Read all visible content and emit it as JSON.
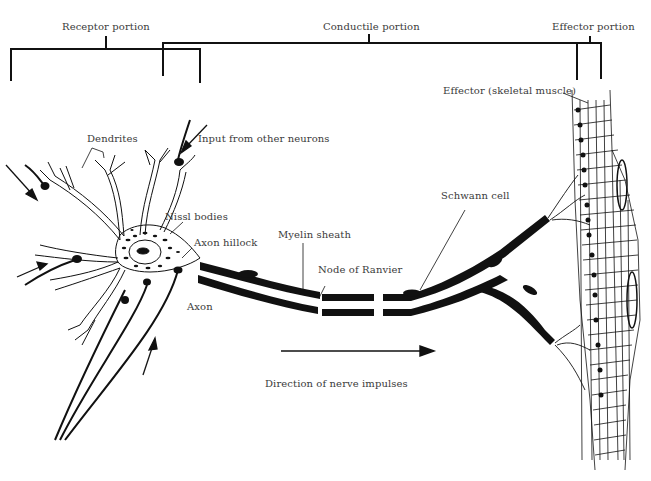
{
  "diagram": {
    "type": "anatomical-illustration",
    "portions": {
      "receptor": "Receptor portion",
      "conductile": "Conductile portion",
      "effector": "Effector portion"
    },
    "labels": {
      "dendrites": "Dendrites",
      "input": "Input from other neurons",
      "nissl": "Nissl bodies",
      "hillock": "Axon hillock",
      "axon": "Axon",
      "myelin": "Myelin sheath",
      "node": "Node of Ranvier",
      "schwann": "Schwann cell",
      "effector_muscle": "Effector (skeletal muscle)",
      "direction": "Direction of nerve impulses"
    },
    "colors": {
      "ink": "#111111",
      "text": "#3a3a3a",
      "background": "#ffffff"
    }
  }
}
